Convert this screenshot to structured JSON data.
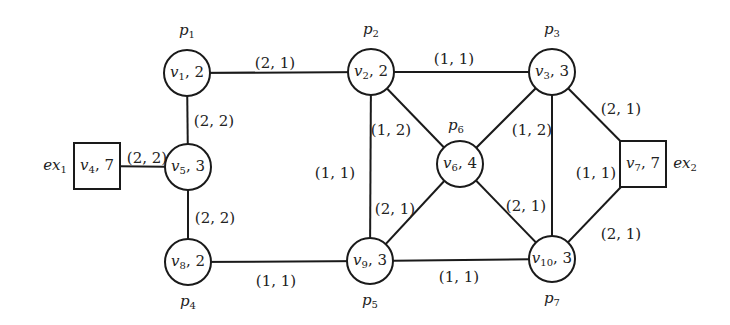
{
  "diagram": {
    "type": "graph",
    "nodes": [
      {
        "id": "v1",
        "name": "v",
        "sub": "1",
        "weight": "2",
        "shape": "circle",
        "x": 187,
        "y": 73,
        "partition": {
          "name": "p",
          "sub": "1",
          "pos": "above"
        }
      },
      {
        "id": "v2",
        "name": "v",
        "sub": "2",
        "weight": "2",
        "shape": "circle",
        "x": 371,
        "y": 72,
        "partition": {
          "name": "p",
          "sub": "2",
          "pos": "above"
        }
      },
      {
        "id": "v3",
        "name": "v",
        "sub": "3",
        "weight": "3",
        "shape": "circle",
        "x": 552,
        "y": 72,
        "partition": {
          "name": "p",
          "sub": "3",
          "pos": "above"
        }
      },
      {
        "id": "v4",
        "name": "v",
        "sub": "4",
        "weight": "7",
        "shape": "square",
        "x": 97,
        "y": 166,
        "external": {
          "name": "ex",
          "sub": "1",
          "pos": "left"
        }
      },
      {
        "id": "v5",
        "name": "v",
        "sub": "5",
        "weight": "3",
        "shape": "circle",
        "x": 188,
        "y": 167
      },
      {
        "id": "v6",
        "name": "v",
        "sub": "6",
        "weight": "4",
        "shape": "circle",
        "x": 460,
        "y": 164,
        "partition": {
          "name": "p",
          "sub": "6",
          "pos": "above-left"
        }
      },
      {
        "id": "v7",
        "name": "v",
        "sub": "7",
        "weight": "7",
        "shape": "square",
        "x": 643,
        "y": 164,
        "external": {
          "name": "ex",
          "sub": "2",
          "pos": "right"
        }
      },
      {
        "id": "v8",
        "name": "v",
        "sub": "8",
        "weight": "2",
        "shape": "circle",
        "x": 188,
        "y": 262,
        "partition": {
          "name": "p",
          "sub": "4",
          "pos": "below"
        }
      },
      {
        "id": "v9",
        "name": "v",
        "sub": "9",
        "weight": "3",
        "shape": "circle",
        "x": 370,
        "y": 261,
        "partition": {
          "name": "p",
          "sub": "5",
          "pos": "below"
        }
      },
      {
        "id": "v10",
        "name": "v",
        "sub": "10",
        "weight": "3",
        "shape": "circle",
        "x": 552,
        "y": 259,
        "partition": {
          "name": "p",
          "sub": "7",
          "pos": "below"
        }
      }
    ],
    "edges": [
      {
        "from": "v1",
        "to": "v2",
        "label": "(2, 1)",
        "lx": 275,
        "ly": 64
      },
      {
        "from": "v1",
        "to": "v5",
        "label": "(2, 2)",
        "lx": 214,
        "ly": 122
      },
      {
        "from": "v4",
        "to": "v5",
        "label": "(2, 2)",
        "lx": 147,
        "ly": 159
      },
      {
        "from": "v5",
        "to": "v8",
        "label": "(2, 2)",
        "lx": 215,
        "ly": 219
      },
      {
        "from": "v8",
        "to": "v9",
        "label": "(1, 1)",
        "lx": 276,
        "ly": 282
      },
      {
        "from": "v2",
        "to": "v3",
        "label": "(1, 1)",
        "lx": 454,
        "ly": 60
      },
      {
        "from": "v2",
        "to": "v9",
        "label": "(1, 1)",
        "lx": 335,
        "ly": 174
      },
      {
        "from": "v2",
        "to": "v6",
        "label": "(1, 2)",
        "lx": 391,
        "ly": 131
      },
      {
        "from": "v3",
        "to": "v6",
        "label": "(1, 2)",
        "lx": 532,
        "ly": 131
      },
      {
        "from": "v6",
        "to": "v9",
        "label": "(2, 1)",
        "lx": 395,
        "ly": 210
      },
      {
        "from": "v6",
        "to": "v10",
        "label": "(2, 1)",
        "lx": 526,
        "ly": 207
      },
      {
        "from": "v9",
        "to": "v10",
        "label": "(1, 1)",
        "lx": 459,
        "ly": 278
      },
      {
        "from": "v3",
        "to": "v10",
        "label": "(1, 1)",
        "lx": 596,
        "ly": 174
      },
      {
        "from": "v3",
        "to": "v7",
        "label": "(2, 1)",
        "lx": 621,
        "ly": 110
      },
      {
        "from": "v7",
        "to": "v10",
        "label": "(2, 1)",
        "lx": 621,
        "ly": 235
      }
    ]
  },
  "colors": {
    "stroke": "#1a1a1a",
    "text": "#222222",
    "background": "#ffffff"
  }
}
